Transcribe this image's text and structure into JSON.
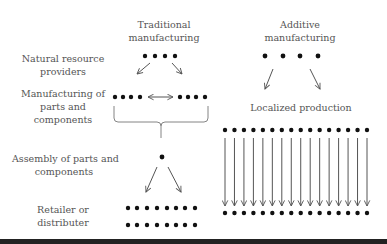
{
  "diagram": {
    "columns": {
      "traditional": {
        "title_line1": "Traditional",
        "title_line2": "manufacturing"
      },
      "additive": {
        "title_line1": "Additive",
        "title_line2": "manufacturing"
      }
    },
    "stages": {
      "natural_resources": {
        "line1": "Natural resource",
        "line2": "providers"
      },
      "manufacturing_parts": {
        "line1": "Manufacturing of",
        "line2": "parts and",
        "line3": "components"
      },
      "assembly": {
        "line1": "Assembly of parts and",
        "line2": "components"
      },
      "retailer": {
        "line1": "Retailer or",
        "line2": "distributer"
      }
    },
    "additive_stage": {
      "label": "Localized production"
    },
    "counts": {
      "traditional_resource_dots": 4,
      "traditional_manufacturing_dots": 8,
      "traditional_assembly_dots": 1,
      "traditional_retailer_rows": 2,
      "traditional_retailer_dots_per_row": 8,
      "additive_top_dots": 4,
      "additive_localized_dots": 16,
      "additive_arrows": 16,
      "additive_bottom_dots": 16
    },
    "colors": {
      "dot": "#111111",
      "arrow": "#555555",
      "text": "#555555",
      "bar": "#222222"
    }
  }
}
